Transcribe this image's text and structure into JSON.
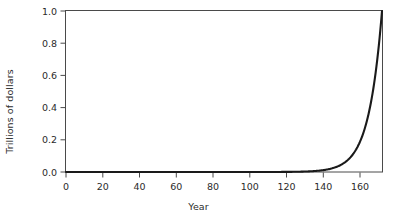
{
  "chart_data": {
    "type": "line",
    "title": "",
    "subtitle": "",
    "xlabel": "Year",
    "ylabel": "Trillions of dollars",
    "xlim": [
      -3,
      173
    ],
    "ylim": [
      0.0,
      1.0
    ],
    "xticks": [
      0,
      20,
      40,
      60,
      80,
      100,
      120,
      140,
      160
    ],
    "xtick_labels": [
      "0",
      "20",
      "40",
      "60",
      "80",
      "100",
      "120",
      "140",
      "160"
    ],
    "yticks": [
      0.0,
      0.2,
      0.4,
      0.6,
      0.8,
      1.0
    ],
    "ytick_labels": [
      "0.0",
      "0.2",
      "0.4",
      "0.6",
      "0.8",
      "1.0"
    ],
    "grid": false,
    "legend": null,
    "annotations": [],
    "series": [
      {
        "name": "Compound growth",
        "color": "#1a1a1a",
        "description": "Exponential curve: value doubles roughly every 5 years, reaching 1.0 trillion dollars at year 173",
        "x": [
          0,
          10,
          20,
          30,
          40,
          50,
          60,
          70,
          80,
          90,
          100,
          110,
          115,
          120,
          125,
          130,
          135,
          140,
          143,
          146,
          149,
          152,
          155,
          158,
          160,
          162,
          164,
          166,
          168,
          170,
          171,
          172,
          173
        ],
        "values": [
          0.0,
          0.0,
          0.0,
          0.0,
          0.0,
          0.0,
          0.0,
          0.0,
          0.001,
          0.002,
          0.004,
          0.007,
          0.01,
          0.014,
          0.019,
          0.026,
          0.035,
          0.049,
          0.06,
          0.073,
          0.089,
          0.108,
          0.132,
          0.161,
          0.185,
          0.212,
          0.243,
          0.279,
          0.32,
          0.367,
          0.42,
          0.55,
          1.0
        ]
      }
    ]
  },
  "axes": {
    "xlabel": "Year",
    "ylabel": "Trillions of dollars"
  }
}
